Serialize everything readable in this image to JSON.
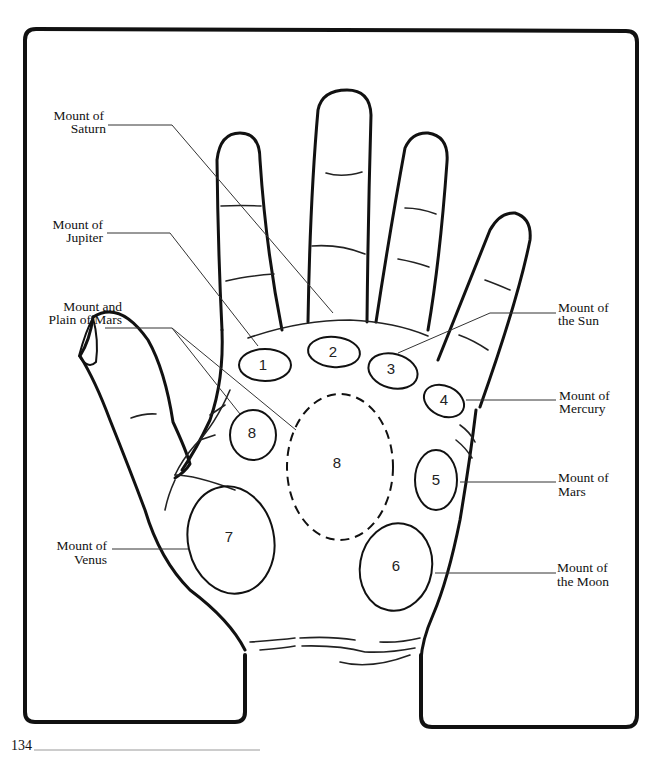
{
  "figure": {
    "page_number": "134"
  },
  "mounts": [
    {
      "number": "1",
      "name": "Mount of Jupiter",
      "label_lines": [
        "Mount of",
        "Jupiter"
      ],
      "side": "left"
    },
    {
      "number": "2",
      "name": "Mount of Saturn",
      "label_lines": [
        "Mount of",
        "Saturn"
      ],
      "side": "left"
    },
    {
      "number": "3",
      "name": "Mount of the Sun",
      "label_lines": [
        "Mount of",
        "the Sun"
      ],
      "side": "right"
    },
    {
      "number": "4",
      "name": "Mount of Mercury",
      "label_lines": [
        "Mount of",
        "Mercury"
      ],
      "side": "right"
    },
    {
      "number": "5",
      "name": "Mount of Mars",
      "label_lines": [
        "Mount of",
        "Mars"
      ],
      "side": "right"
    },
    {
      "number": "6",
      "name": "Mount of the Moon",
      "label_lines": [
        "Mount of",
        "the Moon"
      ],
      "side": "right"
    },
    {
      "number": "7",
      "name": "Mount of Venus",
      "label_lines": [
        "Mount of",
        "Venus"
      ],
      "side": "left"
    },
    {
      "number": "8",
      "name": "Mount and Plain of Mars",
      "label_lines": [
        "Mount and",
        "Plain of Mars"
      ],
      "side": "left"
    }
  ],
  "colors": {
    "ink": "#111111",
    "background": "#ffffff"
  }
}
